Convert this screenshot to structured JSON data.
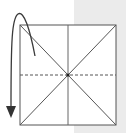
{
  "diagram": {
    "type": "origami-fold-step",
    "creases": [
      {
        "name": "vertical-center",
        "style": "solid"
      },
      {
        "name": "diagonal-tl-br",
        "style": "solid"
      },
      {
        "name": "diagonal-tr-bl",
        "style": "solid"
      },
      {
        "name": "horizontal-center",
        "style": "dashed",
        "meaning": "valley-fold line"
      }
    ],
    "arrow": {
      "meaning": "fold-behind",
      "direction": "down"
    },
    "colors": {
      "line": "#555555",
      "paper": "#ffffff",
      "background_band": "#ebebeb",
      "arrow": "#3a3a3a"
    }
  }
}
